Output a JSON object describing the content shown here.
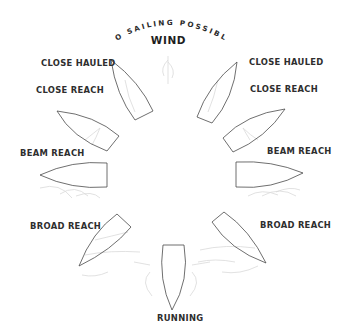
{
  "diagram": {
    "title_arc": "NO SAILING POSSIBLE",
    "wind_label": "WIND",
    "colors": {
      "text": "#2e2e2e",
      "hull_outline": "#4a4a4a",
      "sail_faint": "#d9d9d9",
      "background": "#ffffff"
    },
    "points_of_sail": [
      {
        "id": "close-hauled-left",
        "label": "CLOSE HAULED",
        "side": "port"
      },
      {
        "id": "close-reach-left",
        "label": "CLOSE REACH",
        "side": "port"
      },
      {
        "id": "beam-reach-left",
        "label": "BEAM REACH",
        "side": "port"
      },
      {
        "id": "broad-reach-left",
        "label": "BROAD REACH",
        "side": "port"
      },
      {
        "id": "running",
        "label": "RUNNING",
        "side": "center"
      },
      {
        "id": "broad-reach-right",
        "label": "BROAD REACH",
        "side": "starboard"
      },
      {
        "id": "beam-reach-right",
        "label": "BEAM REACH",
        "side": "starboard"
      },
      {
        "id": "close-reach-right",
        "label": "CLOSE REACH",
        "side": "starboard"
      },
      {
        "id": "close-hauled-right",
        "label": "CLOSE HAULED",
        "side": "starboard"
      }
    ]
  }
}
